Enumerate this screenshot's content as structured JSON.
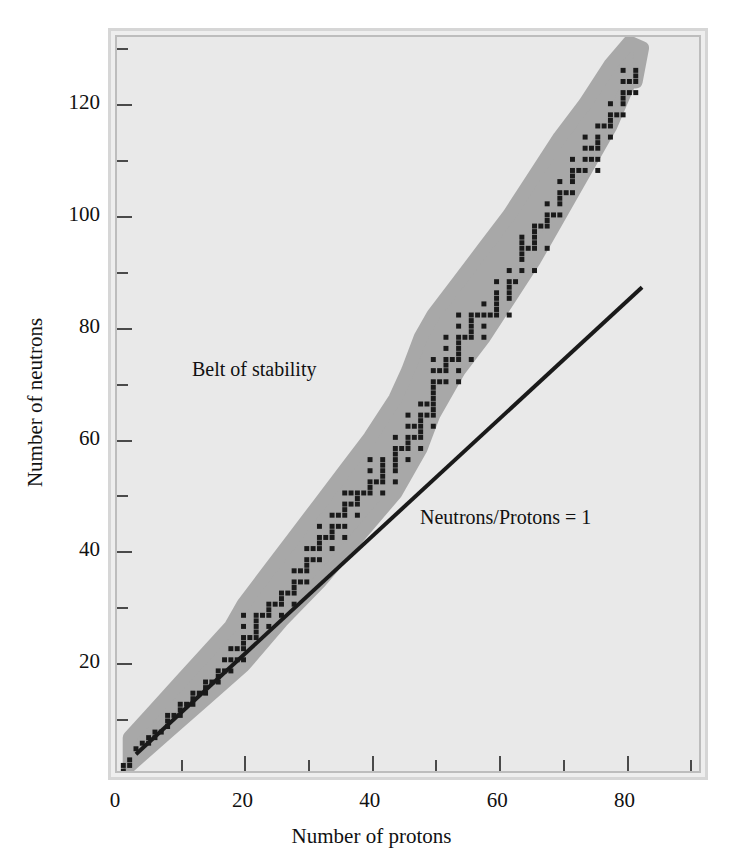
{
  "figure": {
    "background_color": "#ffffff",
    "plot_background_color": "#e9e9e9",
    "frame_color": "#d6d6d6",
    "band_color": "#a8a8a8",
    "dot_color": "#1a1a1a",
    "line_color": "#1a1a1a"
  },
  "chart_data": {
    "type": "scatter",
    "title": "",
    "xlabel": "Number of protons",
    "ylabel": "Number of neutrons",
    "xlim": [
      0,
      92
    ],
    "ylim": [
      0,
      132
    ],
    "grid": false,
    "legend": "none",
    "x_ticks_major": [
      0,
      20,
      40,
      60,
      80
    ],
    "x_ticks_minor": [
      10,
      30,
      50,
      70,
      90
    ],
    "y_ticks_major": [
      20,
      40,
      60,
      80,
      100,
      120
    ],
    "y_ticks_minor": [
      10,
      30,
      50,
      70,
      90,
      110,
      130
    ],
    "annotations": [
      {
        "text": "Belt of stability",
        "x": 14,
        "y": 72
      },
      {
        "text": "Neutrons/Protons = 1",
        "x": 48,
        "y": 48
      }
    ],
    "series": [
      {
        "name": "Neutrons/Protons = 1",
        "type": "line",
        "points": [
          [
            3,
            3
          ],
          [
            83,
            87
          ]
        ]
      },
      {
        "name": "Belt of stability",
        "type": "band",
        "upper": [
          [
            2,
            6
          ],
          [
            6,
            11
          ],
          [
            10,
            16
          ],
          [
            14,
            21
          ],
          [
            18,
            26
          ],
          [
            20,
            30
          ],
          [
            24,
            36
          ],
          [
            28,
            42
          ],
          [
            32,
            48
          ],
          [
            36,
            54
          ],
          [
            40,
            60
          ],
          [
            44,
            67
          ],
          [
            46,
            72
          ],
          [
            48,
            78
          ],
          [
            50,
            82
          ],
          [
            54,
            88
          ],
          [
            58,
            94
          ],
          [
            62,
            100
          ],
          [
            66,
            107
          ],
          [
            70,
            114
          ],
          [
            74,
            120
          ],
          [
            78,
            127
          ],
          [
            81,
            131
          ],
          [
            83,
            130
          ],
          [
            82,
            124
          ]
        ],
        "lower": [
          [
            2,
            1
          ],
          [
            8,
            7
          ],
          [
            14,
            13
          ],
          [
            20,
            19
          ],
          [
            26,
            27
          ],
          [
            32,
            34
          ],
          [
            38,
            42
          ],
          [
            44,
            50
          ],
          [
            48,
            58
          ],
          [
            50,
            64
          ],
          [
            54,
            72
          ],
          [
            58,
            78
          ],
          [
            62,
            85
          ],
          [
            66,
            92
          ],
          [
            70,
            100
          ],
          [
            74,
            108
          ],
          [
            78,
            116
          ],
          [
            81,
            124
          ]
        ]
      },
      {
        "name": "Stable nuclides",
        "type": "scatter",
        "marker": "square",
        "points": [
          [
            1,
            0
          ],
          [
            1,
            1
          ],
          [
            2,
            1
          ],
          [
            2,
            2
          ],
          [
            3,
            4
          ],
          [
            4,
            5
          ],
          [
            5,
            5
          ],
          [
            5,
            6
          ],
          [
            6,
            6
          ],
          [
            6,
            7
          ],
          [
            7,
            7
          ],
          [
            8,
            8
          ],
          [
            8,
            9
          ],
          [
            8,
            10
          ],
          [
            9,
            10
          ],
          [
            10,
            10
          ],
          [
            10,
            11
          ],
          [
            10,
            12
          ],
          [
            11,
            12
          ],
          [
            12,
            12
          ],
          [
            12,
            13
          ],
          [
            12,
            14
          ],
          [
            13,
            14
          ],
          [
            14,
            14
          ],
          [
            14,
            15
          ],
          [
            14,
            16
          ],
          [
            15,
            16
          ],
          [
            16,
            16
          ],
          [
            16,
            17
          ],
          [
            16,
            18
          ],
          [
            17,
            18
          ],
          [
            17,
            20
          ],
          [
            18,
            18
          ],
          [
            18,
            20
          ],
          [
            18,
            22
          ],
          [
            19,
            20
          ],
          [
            19,
            22
          ],
          [
            20,
            20
          ],
          [
            20,
            22
          ],
          [
            20,
            23
          ],
          [
            20,
            24
          ],
          [
            20,
            26
          ],
          [
            20,
            28
          ],
          [
            21,
            24
          ],
          [
            22,
            24
          ],
          [
            22,
            25
          ],
          [
            22,
            26
          ],
          [
            22,
            27
          ],
          [
            22,
            28
          ],
          [
            23,
            28
          ],
          [
            24,
            26
          ],
          [
            24,
            28
          ],
          [
            24,
            29
          ],
          [
            24,
            30
          ],
          [
            25,
            30
          ],
          [
            26,
            28
          ],
          [
            26,
            30
          ],
          [
            26,
            31
          ],
          [
            26,
            32
          ],
          [
            27,
            32
          ],
          [
            28,
            30
          ],
          [
            28,
            32
          ],
          [
            28,
            33
          ],
          [
            28,
            34
          ],
          [
            28,
            36
          ],
          [
            29,
            34
          ],
          [
            29,
            36
          ],
          [
            30,
            34
          ],
          [
            30,
            36
          ],
          [
            30,
            37
          ],
          [
            30,
            38
          ],
          [
            30,
            40
          ],
          [
            31,
            38
          ],
          [
            31,
            40
          ],
          [
            32,
            38
          ],
          [
            32,
            40
          ],
          [
            32,
            41
          ],
          [
            32,
            42
          ],
          [
            32,
            44
          ],
          [
            33,
            42
          ],
          [
            34,
            40
          ],
          [
            34,
            42
          ],
          [
            34,
            43
          ],
          [
            34,
            44
          ],
          [
            34,
            46
          ],
          [
            35,
            44
          ],
          [
            35,
            46
          ],
          [
            36,
            42
          ],
          [
            36,
            44
          ],
          [
            36,
            46
          ],
          [
            36,
            47
          ],
          [
            36,
            48
          ],
          [
            36,
            50
          ],
          [
            37,
            48
          ],
          [
            37,
            50
          ],
          [
            38,
            46
          ],
          [
            38,
            48
          ],
          [
            38,
            49
          ],
          [
            38,
            50
          ],
          [
            39,
            50
          ],
          [
            40,
            50
          ],
          [
            40,
            51
          ],
          [
            40,
            52
          ],
          [
            40,
            54
          ],
          [
            40,
            56
          ],
          [
            41,
            52
          ],
          [
            42,
            50
          ],
          [
            42,
            52
          ],
          [
            42,
            53
          ],
          [
            42,
            54
          ],
          [
            42,
            55
          ],
          [
            42,
            56
          ],
          [
            44,
            52
          ],
          [
            44,
            54
          ],
          [
            44,
            55
          ],
          [
            44,
            56
          ],
          [
            44,
            57
          ],
          [
            44,
            58
          ],
          [
            44,
            60
          ],
          [
            45,
            58
          ],
          [
            46,
            56
          ],
          [
            46,
            58
          ],
          [
            46,
            59
          ],
          [
            46,
            60
          ],
          [
            46,
            62
          ],
          [
            46,
            64
          ],
          [
            47,
            60
          ],
          [
            47,
            62
          ],
          [
            48,
            58
          ],
          [
            48,
            60
          ],
          [
            48,
            61
          ],
          [
            48,
            62
          ],
          [
            48,
            63
          ],
          [
            48,
            64
          ],
          [
            48,
            66
          ],
          [
            49,
            64
          ],
          [
            49,
            66
          ],
          [
            50,
            62
          ],
          [
            50,
            64
          ],
          [
            50,
            65
          ],
          [
            50,
            66
          ],
          [
            50,
            67
          ],
          [
            50,
            68
          ],
          [
            50,
            69
          ],
          [
            50,
            70
          ],
          [
            50,
            72
          ],
          [
            50,
            74
          ],
          [
            51,
            70
          ],
          [
            51,
            72
          ],
          [
            52,
            70
          ],
          [
            52,
            72
          ],
          [
            52,
            73
          ],
          [
            52,
            74
          ],
          [
            52,
            76
          ],
          [
            52,
            78
          ],
          [
            53,
            74
          ],
          [
            54,
            70
          ],
          [
            54,
            72
          ],
          [
            54,
            74
          ],
          [
            54,
            75
          ],
          [
            54,
            76
          ],
          [
            54,
            77
          ],
          [
            54,
            78
          ],
          [
            54,
            80
          ],
          [
            54,
            82
          ],
          [
            55,
            78
          ],
          [
            56,
            74
          ],
          [
            56,
            78
          ],
          [
            56,
            79
          ],
          [
            56,
            80
          ],
          [
            56,
            81
          ],
          [
            56,
            82
          ],
          [
            57,
            82
          ],
          [
            58,
            78
          ],
          [
            58,
            80
          ],
          [
            58,
            82
          ],
          [
            58,
            84
          ],
          [
            59,
            82
          ],
          [
            60,
            82
          ],
          [
            60,
            83
          ],
          [
            60,
            84
          ],
          [
            60,
            85
          ],
          [
            60,
            86
          ],
          [
            60,
            88
          ],
          [
            62,
            82
          ],
          [
            62,
            85
          ],
          [
            62,
            86
          ],
          [
            62,
            87
          ],
          [
            62,
            88
          ],
          [
            62,
            90
          ],
          [
            63,
            88
          ],
          [
            64,
            90
          ],
          [
            64,
            92
          ],
          [
            64,
            93
          ],
          [
            64,
            94
          ],
          [
            64,
            95
          ],
          [
            64,
            96
          ],
          [
            65,
            94
          ],
          [
            66,
            90
          ],
          [
            66,
            94
          ],
          [
            66,
            95
          ],
          [
            66,
            96
          ],
          [
            66,
            97
          ],
          [
            66,
            98
          ],
          [
            67,
            98
          ],
          [
            68,
            94
          ],
          [
            68,
            98
          ],
          [
            68,
            99
          ],
          [
            68,
            100
          ],
          [
            68,
            102
          ],
          [
            69,
            100
          ],
          [
            70,
            100
          ],
          [
            70,
            102
          ],
          [
            70,
            103
          ],
          [
            70,
            104
          ],
          [
            70,
            106
          ],
          [
            71,
            104
          ],
          [
            72,
            104
          ],
          [
            72,
            106
          ],
          [
            72,
            107
          ],
          [
            72,
            108
          ],
          [
            72,
            110
          ],
          [
            73,
            108
          ],
          [
            74,
            108
          ],
          [
            74,
            110
          ],
          [
            74,
            112
          ],
          [
            74,
            114
          ],
          [
            75,
            110
          ],
          [
            75,
            112
          ],
          [
            76,
            108
          ],
          [
            76,
            110
          ],
          [
            76,
            112
          ],
          [
            76,
            113
          ],
          [
            76,
            114
          ],
          [
            76,
            116
          ],
          [
            77,
            116
          ],
          [
            78,
            114
          ],
          [
            78,
            116
          ],
          [
            78,
            117
          ],
          [
            78,
            118
          ],
          [
            78,
            120
          ],
          [
            79,
            118
          ],
          [
            80,
            118
          ],
          [
            80,
            120
          ],
          [
            80,
            121
          ],
          [
            80,
            122
          ],
          [
            80,
            124
          ],
          [
            80,
            126
          ],
          [
            81,
            122
          ],
          [
            81,
            124
          ],
          [
            82,
            122
          ],
          [
            82,
            124
          ],
          [
            82,
            125
          ],
          [
            82,
            126
          ]
        ]
      }
    ]
  }
}
